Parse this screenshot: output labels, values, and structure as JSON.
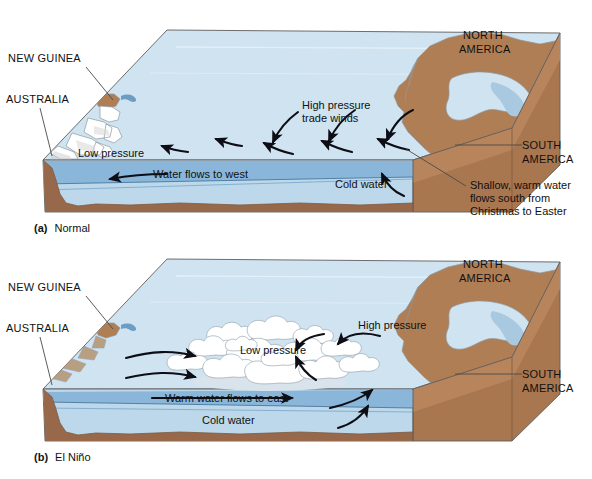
{
  "figure": {
    "panels": [
      {
        "id": "panel-a",
        "caption_prefix": "(a)",
        "caption_text": "Normal",
        "labels": {
          "new_guinea": "NEW GUINEA",
          "australia": "AUSTRALIA",
          "north_america": "NORTH\nAMERICA",
          "north_america_line1": "NORTH",
          "north_america_line2": "AMERICA",
          "south_america_line1": "SOUTH",
          "south_america_line2": "AMERICA",
          "low_pressure": "Low pressure",
          "high_pressure_line1": "High pressure",
          "high_pressure_line2": "trade winds",
          "water_flow": "Water flows to west",
          "cold_water": "Cold water",
          "callout_line1": "Shallow, warm water",
          "callout_line2": "flows south from",
          "callout_line3": "Christmas to Easter"
        }
      },
      {
        "id": "panel-b",
        "caption_prefix": "(b)",
        "caption_text": "El Niño",
        "labels": {
          "new_guinea": "NEW GUINEA",
          "australia": "AUSTRALIA",
          "north_america_line1": "NORTH",
          "north_america_line2": "AMERICA",
          "south_america_line1": "SOUTH",
          "south_america_line2": "AMERICA",
          "low_pressure": "Low pressure",
          "high_pressure": "High pressure",
          "water_flow": "Warm water flows to east",
          "cold_water": "Cold water"
        }
      }
    ],
    "colors": {
      "surface_water": "#cfe3f0",
      "warm_water_band": "#8ab6da",
      "deep_water": "#bcd8ea",
      "land_top": "#b07e54",
      "land_face": "#97684a",
      "land_side": "#a8764f",
      "cloud": "#ffffff",
      "arrow": "#0d0d16",
      "text": "#111111",
      "background": "#ffffff"
    }
  }
}
